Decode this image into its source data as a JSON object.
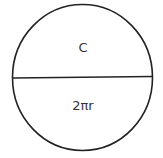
{
  "diagram": {
    "shape": "circle",
    "divider": "horizontal-diameter",
    "top_label": "C",
    "bottom_label": "2πr",
    "stroke_color": "#222222",
    "text_color": "#333333",
    "background": "#ffffff"
  }
}
